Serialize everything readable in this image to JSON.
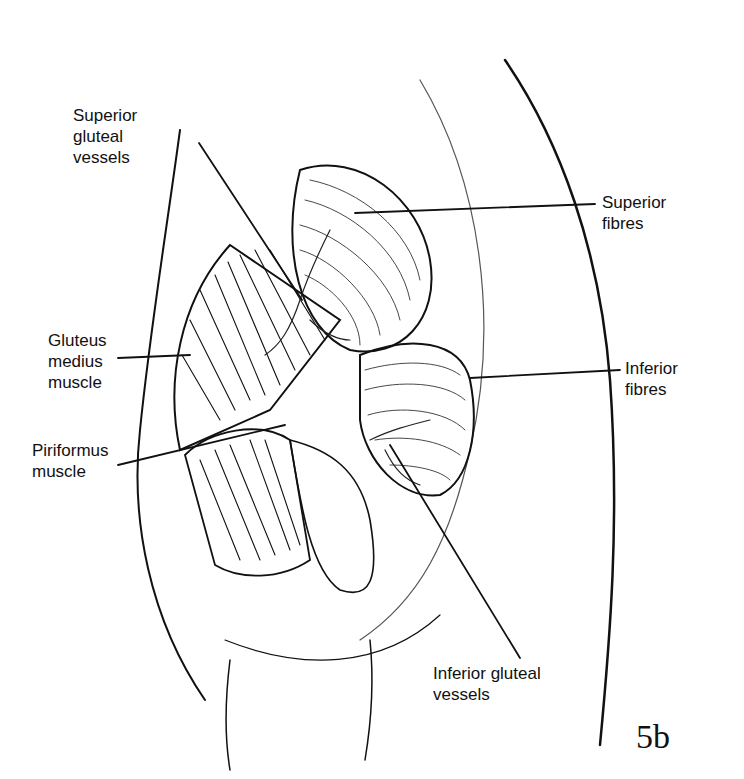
{
  "figure": {
    "number": "5b",
    "labels": [
      {
        "id": "superior-gluteal-vessels",
        "text": "Superior\ngluteal\nvessels"
      },
      {
        "id": "superior-fibres",
        "text": "Superior\nfibres"
      },
      {
        "id": "gluteus-medius-muscle",
        "text": "Gluteus\nmedius\nmuscle"
      },
      {
        "id": "inferior-fibres",
        "text": "Inferior\nfibres"
      },
      {
        "id": "piriformus-muscle",
        "text": "Piriformus\nmuscle"
      },
      {
        "id": "inferior-gluteal-vessels",
        "text": "Inferior gluteal\nvessels"
      }
    ]
  }
}
